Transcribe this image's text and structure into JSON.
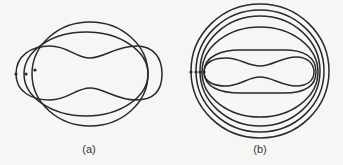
{
  "figure": {
    "panels": [
      {
        "id": "a",
        "caption": "(a)",
        "description": "Three intersecting closed curves: a tall ellipse, a wider flattened ellipse, and a pinched peanut-shaped curve, with three marked points on the left side"
      },
      {
        "id": "b",
        "caption": "(b)",
        "description": "Nested closed curves: three concentric near-circles, an inner ellipse, a flattened oval, and an innermost pinched peanut-shaped curve, with marked points on the left side"
      }
    ],
    "colors": {
      "stroke": "#2a2a2a",
      "background": "#f6f6f4"
    }
  }
}
